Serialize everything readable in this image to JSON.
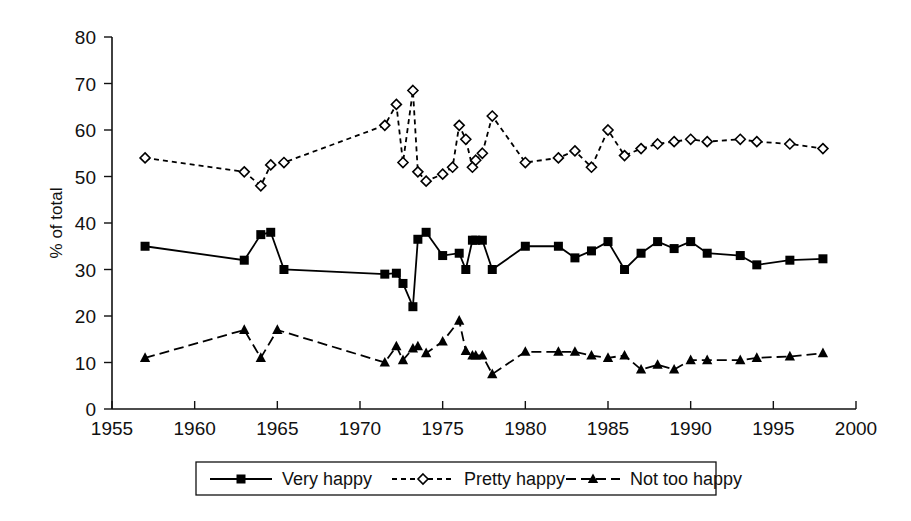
{
  "chart_data": {
    "type": "line",
    "title": "",
    "xlabel": "",
    "ylabel": "% of total",
    "xlim": [
      1955,
      2000
    ],
    "ylim": [
      0,
      80
    ],
    "ytick_step": 10,
    "xtick_step": 5,
    "xticks": [
      "1955",
      "1960",
      "1965",
      "1970",
      "1975",
      "1980",
      "1985",
      "1990",
      "1995",
      "2000"
    ],
    "yticks": [
      "0",
      "10",
      "20",
      "30",
      "40",
      "50",
      "60",
      "70",
      "80"
    ],
    "grid": false,
    "legend_position": "bottom",
    "series": [
      {
        "name": "Very happy",
        "marker": "filled-square",
        "line_style": "solid",
        "x": [
          1957,
          1963,
          1964,
          1964.6,
          1965.4,
          1971.5,
          1972.2,
          1972.6,
          1973.2,
          1973.5,
          1974,
          1975,
          1976,
          1976.4,
          1976.8,
          1977,
          1977.4,
          1978,
          1980,
          1982,
          1983,
          1984,
          1985,
          1986,
          1987,
          1988,
          1989,
          1990,
          1991,
          1993,
          1994,
          1996,
          1998
        ],
        "y": [
          35,
          32,
          37.5,
          38,
          30,
          29,
          29.2,
          27,
          22,
          36.5,
          38,
          33,
          33.5,
          30,
          36.3,
          36.3,
          36.3,
          30,
          35,
          35,
          32.5,
          34,
          36,
          30,
          33.5,
          36,
          34.5,
          36,
          33.5,
          33,
          31,
          32,
          32.3
        ]
      },
      {
        "name": "Pretty happy",
        "marker": "open-diamond",
        "line_style": "dotted",
        "x": [
          1957,
          1963,
          1964,
          1964.6,
          1965.4,
          1971.5,
          1972.2,
          1972.6,
          1973.2,
          1973.5,
          1974,
          1975,
          1975.6,
          1976,
          1976.4,
          1976.8,
          1977,
          1977.4,
          1978,
          1980,
          1982,
          1983,
          1984,
          1985,
          1986,
          1987,
          1988,
          1989,
          1990,
          1991,
          1993,
          1994,
          1996,
          1998
        ],
        "y": [
          54,
          51,
          48,
          52.5,
          53,
          61,
          65.5,
          53,
          68.5,
          51,
          49,
          50.5,
          52,
          61,
          58,
          52,
          53.5,
          55,
          63,
          53,
          54,
          55.5,
          52,
          60,
          54.5,
          56,
          57,
          57.5,
          58,
          57.5,
          58,
          57.5,
          57,
          56
        ]
      },
      {
        "name": "Not too happy",
        "marker": "filled-triangle",
        "line_style": "dashed",
        "x": [
          1957,
          1963,
          1964,
          1965,
          1971.5,
          1972.2,
          1972.6,
          1973.2,
          1973.5,
          1974,
          1975,
          1976,
          1976.4,
          1976.8,
          1977,
          1977.4,
          1978,
          1980,
          1982,
          1983,
          1984,
          1985,
          1986,
          1987,
          1988,
          1989,
          1990,
          1991,
          1993,
          1994,
          1996,
          1998
        ],
        "y": [
          11,
          17,
          11,
          17,
          10,
          13.5,
          10.5,
          13,
          13.5,
          12,
          14.5,
          19,
          12.5,
          11.5,
          11.5,
          11.5,
          7.5,
          12.3,
          12.3,
          12.3,
          11.5,
          11,
          11.5,
          8.5,
          9.5,
          8.5,
          10.5,
          10.5,
          10.5,
          11,
          11.3,
          12
        ]
      }
    ]
  },
  "legend": {
    "items": [
      {
        "label": "Very happy",
        "marker": "filled-square",
        "line_style": "solid"
      },
      {
        "label": "Pretty happy",
        "marker": "open-diamond",
        "line_style": "dotted"
      },
      {
        "label": "Not too happy",
        "marker": "filled-triangle",
        "line_style": "dashed"
      }
    ]
  },
  "colors": {
    "ink": "#000000",
    "background": "#ffffff"
  }
}
